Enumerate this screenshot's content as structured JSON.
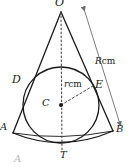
{
  "figure": {
    "caption": "A",
    "stroke_color": "#1a1a1a",
    "arrow_color": "#6e6e6e",
    "dash_color": "#4a4a4a",
    "caption_color": "#b8b8b8"
  },
  "labels": {
    "apex": "O",
    "tangent_left": "D",
    "tangent_right": "E",
    "center": "C",
    "bottom_tangent": "T",
    "base_left": "A",
    "base_right": "B"
  },
  "measures": {
    "radius_value": "r",
    "radius_unit": "cm",
    "slant_value": "R",
    "slant_unit": "cm"
  },
  "geometry": {
    "apex": [
      61,
      12
    ],
    "base_left": [
      13,
      133
    ],
    "base_right": [
      113,
      131
    ],
    "center": [
      61,
      105
    ],
    "circle_radius": 38,
    "tangent_left": [
      25,
      84
    ],
    "tangent_right": [
      93,
      86
    ],
    "bottom_tangent": [
      62,
      145
    ],
    "axis_from": [
      61,
      12
    ],
    "axis_to": [
      62,
      150
    ],
    "radius_line_from": [
      61,
      105
    ],
    "radius_line_to": [
      93,
      86
    ],
    "slant_arrow_from": [
      84,
      8
    ],
    "slant_arrow_to": [
      121,
      125
    ]
  }
}
